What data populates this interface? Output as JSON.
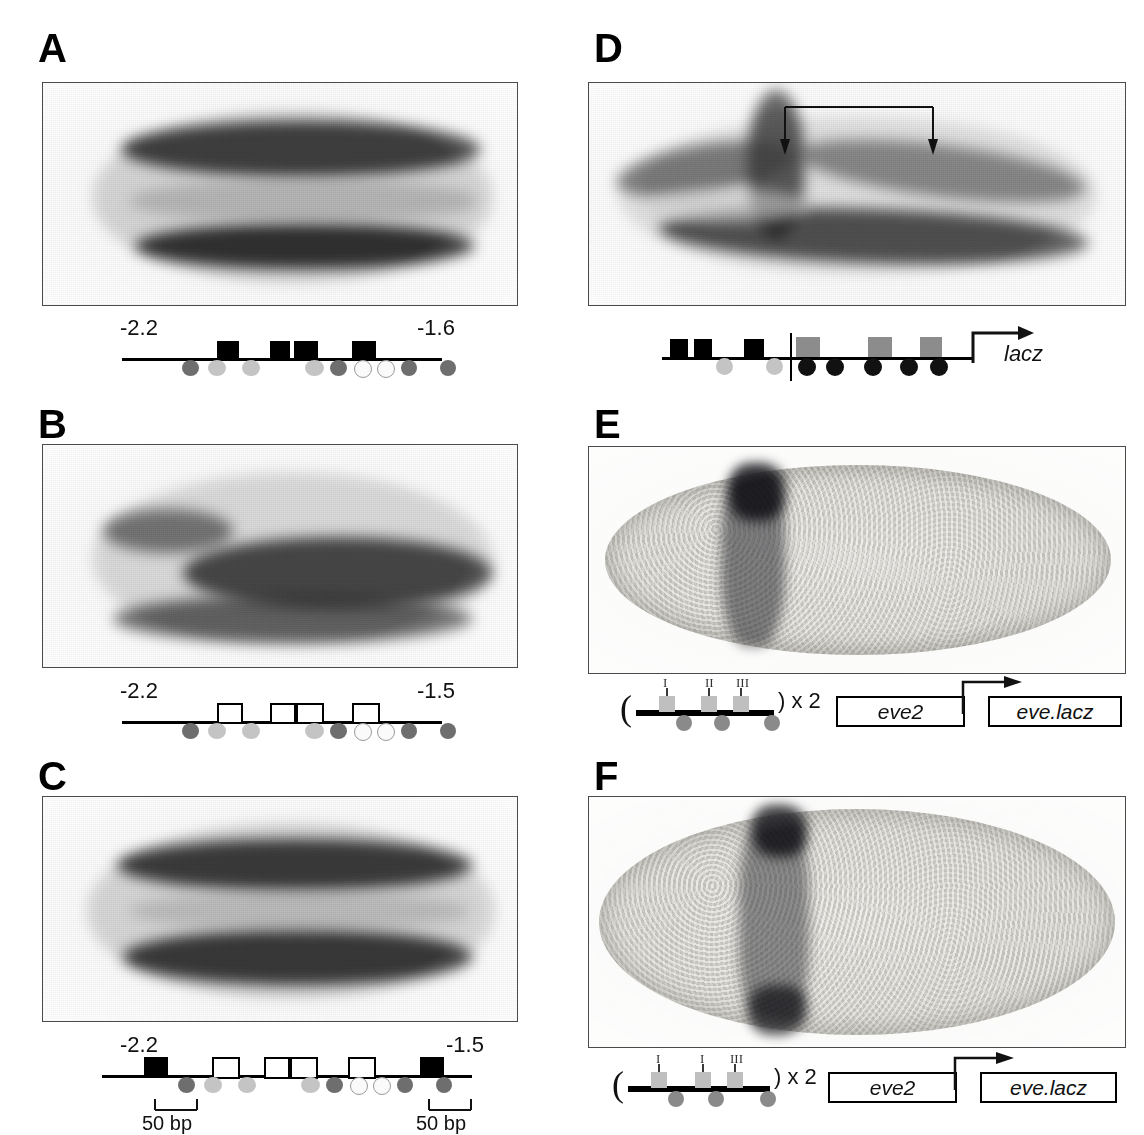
{
  "figure": {
    "panels": [
      {
        "id": "A",
        "letter": "A",
        "coord_left": "-2.2",
        "coord_right": "-1.6",
        "image_kind": "embryo-dorsal-view-two-stripes",
        "boxes": [
          {
            "type": "filled",
            "x": 95,
            "w": 22
          },
          {
            "type": "filled",
            "x": 148,
            "w": 20
          },
          {
            "type": "filled",
            "x": 172,
            "w": 24
          },
          {
            "type": "filled",
            "x": 230,
            "w": 24
          }
        ],
        "circles": [
          {
            "shade": "dark",
            "x": 60
          },
          {
            "shade": "light",
            "x": 86
          },
          {
            "shade": "light",
            "x": 120
          },
          {
            "shade": "light",
            "x": 183
          },
          {
            "shade": "dark",
            "x": 208
          },
          {
            "shade": "open",
            "x": 232
          },
          {
            "shade": "open",
            "x": 255
          },
          {
            "shade": "dark",
            "x": 279
          },
          {
            "shade": "dark",
            "x": 318
          }
        ]
      },
      {
        "id": "B",
        "letter": "B",
        "coord_left": "-2.2",
        "coord_right": "-1.5",
        "image_kind": "embryo-dorsal-view-broad-stripe",
        "boxes": [
          {
            "type": "open",
            "x": 95,
            "w": 22
          },
          {
            "type": "open",
            "x": 148,
            "w": 22
          },
          {
            "type": "open",
            "x": 174,
            "w": 24
          },
          {
            "type": "open",
            "x": 230,
            "w": 24
          }
        ],
        "circles": [
          {
            "shade": "dark",
            "x": 60
          },
          {
            "shade": "light",
            "x": 86
          },
          {
            "shade": "light",
            "x": 120
          },
          {
            "shade": "light",
            "x": 183
          },
          {
            "shade": "dark",
            "x": 208
          },
          {
            "shade": "open",
            "x": 232
          },
          {
            "shade": "open",
            "x": 255
          },
          {
            "shade": "dark",
            "x": 279
          },
          {
            "shade": "dark",
            "x": 318
          }
        ]
      },
      {
        "id": "C",
        "letter": "C",
        "coord_left": "-2.2",
        "coord_right": "-1.5",
        "image_kind": "embryo-dorsal-view-two-stripes",
        "scale_label_left": "50 bp",
        "scale_label_right": "50 bp",
        "boxes": [
          {
            "type": "filled",
            "x": 42,
            "w": 24
          },
          {
            "type": "open",
            "x": 110,
            "w": 24
          },
          {
            "type": "open",
            "x": 162,
            "w": 22
          },
          {
            "type": "open",
            "x": 188,
            "w": 24
          },
          {
            "type": "open",
            "x": 246,
            "w": 24
          },
          {
            "type": "filled",
            "x": 318,
            "w": 24
          }
        ],
        "circles": [
          {
            "shade": "dark",
            "x": 76
          },
          {
            "shade": "light",
            "x": 102
          },
          {
            "shade": "light",
            "x": 136
          },
          {
            "shade": "light",
            "x": 199
          },
          {
            "shade": "dark",
            "x": 224
          },
          {
            "shade": "open",
            "x": 248
          },
          {
            "shade": "open",
            "x": 271
          },
          {
            "shade": "dark",
            "x": 295
          },
          {
            "shade": "dark",
            "x": 334
          }
        ]
      },
      {
        "id": "D",
        "letter": "D",
        "image_kind": "embryo-lateral-ventral-furrow-with-arrows",
        "reporter_label": "lacz",
        "annotation": "bracket-with-two-down-arrows",
        "boxes": [
          {
            "type": "filled",
            "x": 8,
            "w": 18
          },
          {
            "type": "filled",
            "x": 32,
            "w": 18
          },
          {
            "type": "filled",
            "x": 82,
            "w": 20
          },
          {
            "type": "gray",
            "x": 140,
            "w": 24
          },
          {
            "type": "gray",
            "x": 212,
            "w": 24
          },
          {
            "type": "gray",
            "x": 262,
            "w": 22
          }
        ],
        "circles": [
          {
            "shade": "light",
            "x": 56
          },
          {
            "shade": "light",
            "x": 106
          },
          {
            "shade": "black",
            "x": 142
          },
          {
            "shade": "black",
            "x": 168
          },
          {
            "shade": "black",
            "x": 204
          },
          {
            "shade": "black",
            "x": 238
          },
          {
            "shade": "black",
            "x": 268
          }
        ],
        "divider_x": 128
      },
      {
        "id": "E",
        "letter": "E",
        "image_kind": "whole-embryo-lateral-single-stripe",
        "site_labels": [
          "I",
          "II",
          "III"
        ],
        "multimer": ") x 2",
        "paren_open": "(",
        "genes": [
          "eve2",
          "eve.lacz"
        ],
        "boxes": [
          {
            "type": "lightgray",
            "x": 22,
            "w": 16
          },
          {
            "type": "lightgray",
            "x": 66,
            "w": 16
          },
          {
            "type": "lightgray",
            "x": 100,
            "w": 16
          }
        ],
        "circles": [
          {
            "shade": "mid",
            "x": 38
          },
          {
            "shade": "mid",
            "x": 74
          },
          {
            "shade": "mid",
            "x": 124
          }
        ]
      },
      {
        "id": "F",
        "letter": "F",
        "image_kind": "whole-embryo-lateral-single-stripe",
        "site_labels": [
          "I",
          "I",
          "III"
        ],
        "multimer": ") x 2",
        "paren_open": "(",
        "genes": [
          "eve2",
          "eve.lacz"
        ],
        "boxes": [
          {
            "type": "lightgray",
            "x": 22,
            "w": 16
          },
          {
            "type": "lightgray",
            "x": 66,
            "w": 16
          },
          {
            "type": "lightgray",
            "x": 100,
            "w": 16
          }
        ],
        "circles": [
          {
            "shade": "mid",
            "x": 38
          },
          {
            "shade": "mid",
            "x": 74
          },
          {
            "shade": "mid",
            "x": 124
          }
        ]
      }
    ],
    "colors": {
      "filled_box": "#000000",
      "open_box": "#ffffff",
      "gray_box": "#8c8c8c",
      "light_gray_box": "#bfbfbf",
      "circle_dark": "#6e6e6e",
      "circle_light": "#c4c4c4",
      "circle_open": "#fafafa",
      "circle_black": "#111111",
      "dna_line": "#000000",
      "background": "#ffffff"
    }
  }
}
